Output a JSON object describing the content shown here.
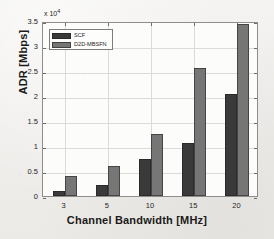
{
  "chart_data": {
    "type": "bar",
    "title": "",
    "subtitle": "",
    "xlabel": "Channel Bandwidth [MHz]",
    "ylabel": "ADR [Mbps]",
    "categories": [
      "3",
      "5",
      "10",
      "15",
      "20"
    ],
    "series": [
      {
        "name": "SCF",
        "color": "#3a3a3a",
        "values": [
          1100,
          2300,
          7400,
          10600,
          20400
        ]
      },
      {
        "name": "D2D-MBSFN",
        "color": "#767676",
        "values": [
          4000,
          6000,
          12400,
          25600,
          34400
        ]
      }
    ],
    "y_multiplier_text": "x 10",
    "y_multiplier_exponent": "4",
    "y_multiplier_value": 10000,
    "yticks": [
      "0",
      "0.5",
      "1",
      "1.5",
      "2",
      "2.5",
      "3",
      "3.5"
    ],
    "ytick_values": [
      0,
      0.5,
      1,
      1.5,
      2,
      2.5,
      3,
      3.5
    ],
    "ylim": [
      0,
      3.5
    ],
    "xtick_labels": [
      "3",
      "5",
      "10",
      "15",
      "20"
    ],
    "grid": true,
    "legend_position": "top-left",
    "legend_entries": [
      "SCF",
      "D2D-MBSFN"
    ]
  },
  "figure": {
    "background_color": "#f2f1ef",
    "plot_background_color": "#fcfcfb",
    "axis_color": "#8e8d8b",
    "grid_color": "#dcdbd8"
  }
}
